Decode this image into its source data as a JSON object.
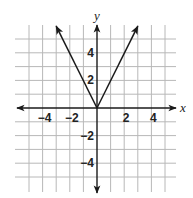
{
  "chart_data": {
    "type": "line",
    "title": "",
    "function": "y = 2|x|",
    "xlabel": "x",
    "ylabel": "y",
    "xlim": [
      -5.5,
      5.5
    ],
    "ylim": [
      -6,
      6
    ],
    "grid": true,
    "grid_step": 1,
    "x_tick_labels": [
      {
        "value": -4,
        "label": "−4"
      },
      {
        "value": -2,
        "label": "−2"
      },
      {
        "value": 2,
        "label": "2"
      },
      {
        "value": 4,
        "label": "4"
      }
    ],
    "y_tick_labels": [
      {
        "value": 4,
        "label": "4"
      },
      {
        "value": 2,
        "label": "2"
      },
      {
        "value": -2,
        "label": "−2"
      },
      {
        "value": -4,
        "label": "−4"
      }
    ],
    "series": [
      {
        "name": "left ray",
        "points": [
          [
            0,
            0
          ],
          [
            -3,
            6
          ]
        ],
        "arrow_at_end": true
      },
      {
        "name": "right ray",
        "points": [
          [
            0,
            0
          ],
          [
            3,
            6
          ]
        ],
        "arrow_at_end": true
      }
    ],
    "vertex": [
      0,
      0
    ],
    "axes_arrows": true
  },
  "labels": {
    "x_axis": "x",
    "y_axis": "y"
  },
  "colors": {
    "grid": "#b8b8b8",
    "axis": "#1a1a1a",
    "line": "#1a1a1a"
  }
}
